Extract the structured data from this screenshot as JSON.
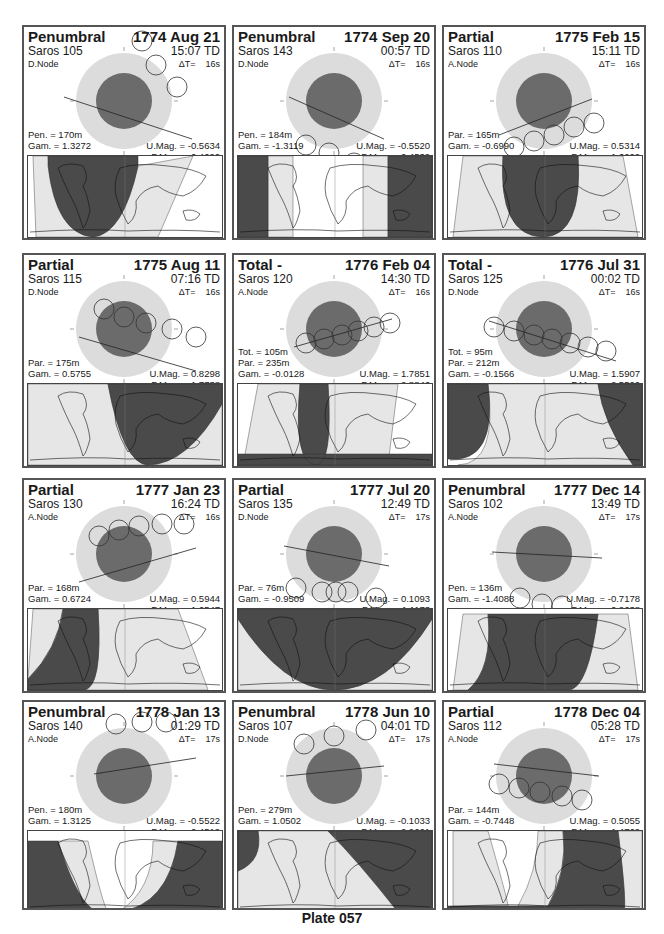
{
  "plate": {
    "title": "Plate 057"
  },
  "colors": {
    "penumbra": "#dcdcdc",
    "umbra": "#6b6b6b",
    "map_dark": "#4a4a4a",
    "map_mid": "#9a9a9a",
    "map_light": "#e6e6e6",
    "border": "#555555"
  },
  "eclipses": [
    {
      "type": "Penumbral",
      "date": "1774 Aug 21",
      "saros": "Saros 105",
      "time": "15:07 TD",
      "node": "D.Node",
      "delta_t": "ΔT=    16s",
      "stats_left": [
        "Pen. = 170m",
        "Gam. = 1.3272"
      ],
      "stats_right": [
        "U.Mag. = -0.5634",
        "P.Mag. = 0.4090"
      ]
    },
    {
      "type": "Penumbral",
      "date": "1774 Sep 20",
      "saros": "Saros 143",
      "time": "00:57 TD",
      "node": "D.Node",
      "delta_t": "ΔT=    16s",
      "stats_left": [
        "Pen. = 184m",
        "Gam. = -1.3119"
      ],
      "stats_right": [
        "U.Mag. = -0.5520",
        "P.Mag. = 0.4539"
      ]
    },
    {
      "type": "Partial",
      "date": "1775 Feb 15",
      "saros": "Saros 110",
      "time": "15:11 TD",
      "node": "A.Node",
      "delta_t": "ΔT=    16s",
      "stats_left": [
        "Par. = 165m",
        "Gam. = -0.6990"
      ],
      "stats_right": [
        "U.Mag. = 0.5314",
        "P.Mag. = 1.6202"
      ]
    },
    {
      "type": "Partial",
      "date": "1775 Aug 11",
      "saros": "Saros 115",
      "time": "07:16 TD",
      "node": "D.Node",
      "delta_t": "ΔT=    16s",
      "stats_left": [
        "Par. = 175m",
        "Gam. = 0.5755"
      ],
      "stats_right": [
        "U.Mag. = 0.8298",
        "P.Mag. = 1.7738"
      ]
    },
    {
      "type": "Total  -",
      "date": "1776 Feb 04",
      "saros": "Saros 120",
      "time": "14:30 TD",
      "node": "A.Node",
      "delta_t": "ΔT=    16s",
      "stats_left": [
        "Tot. = 105m",
        "Par. = 235m",
        "Gam. = -0.0128"
      ],
      "stats_right": [
        "U.Mag. = 1.7851",
        "P.Mag. = 2.8846"
      ]
    },
    {
      "type": "Total  -",
      "date": "1776 Jul 31",
      "saros": "Saros 125",
      "time": "00:02 TD",
      "node": "D.Node",
      "delta_t": "ΔT=    16s",
      "stats_left": [
        "Tot. =  95m",
        "Par. = 212m",
        "Gam. = -0.1566"
      ],
      "stats_right": [
        "U.Mag. = 1.5907",
        "P.Mag. = 2.5500"
      ]
    },
    {
      "type": "Partial",
      "date": "1777 Jan 23",
      "saros": "Saros 130",
      "time": "16:24 TD",
      "node": "A.Node",
      "delta_t": "ΔT=    16s",
      "stats_left": [
        "Par. = 168m",
        "Gam. = 0.6724"
      ],
      "stats_right": [
        "U.Mag. = 0.5944",
        "P.Mag. = 1.6547"
      ]
    },
    {
      "type": "Partial",
      "date": "1777 Jul 20",
      "saros": "Saros 135",
      "time": "12:49 TD",
      "node": "D.Node",
      "delta_t": "ΔT=    17s",
      "stats_left": [
        "Par. =  76m",
        "Gam. = -0.9509"
      ],
      "stats_right": [
        "U.Mag. = 0.1093",
        "P.Mag. = 1.1173"
      ]
    },
    {
      "type": "Penumbral",
      "date": "1777 Dec 14",
      "saros": "Saros 102",
      "time": "13:49 TD",
      "node": "A.Node",
      "delta_t": "ΔT=    17s",
      "stats_left": [
        "Pen. = 136m",
        "Gam. = -1.4088"
      ],
      "stats_right": [
        "U.Mag. = -0.7178",
        "P.Mag. = 0.2638"
      ]
    },
    {
      "type": "Penumbral",
      "date": "1778 Jan 13",
      "saros": "Saros 140",
      "time": "01:29 TD",
      "node": "A.Node",
      "delta_t": "ΔT=    17s",
      "stats_left": [
        "Pen. = 180m",
        "Gam. = 1.3125"
      ],
      "stats_right": [
        "U.Mag. = -0.5522",
        "P.Mag. = 0.4519"
      ]
    },
    {
      "type": "Penumbral",
      "date": "1778 Jun 10",
      "saros": "Saros 107",
      "time": "04:01 TD",
      "node": "D.Node",
      "delta_t": "ΔT=    17s",
      "stats_left": [
        "Pen. = 279m",
        "Gam. = 1.0502"
      ],
      "stats_right": [
        "U.Mag. = -0.1033",
        "P.Mag. = 0.9661"
      ]
    },
    {
      "type": "Partial",
      "date": "1778 Dec 04",
      "saros": "Saros 112",
      "time": "05:28 TD",
      "node": "A.Node",
      "delta_t": "ΔT=    17s",
      "stats_left": [
        "Par. = 144m",
        "Gam. = -0.7448"
      ],
      "stats_right": [
        "U.Mag. = 0.5055",
        "P.Mag. = 1.4769"
      ]
    }
  ]
}
